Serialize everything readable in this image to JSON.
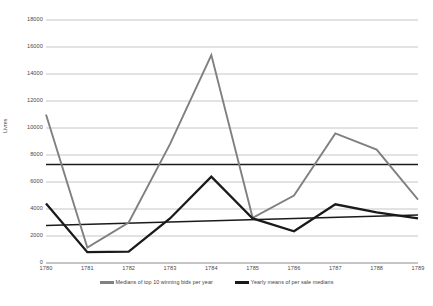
{
  "chart_data": {
    "type": "line",
    "title": "",
    "xlabel": "",
    "ylabel": "Livres",
    "categories": [
      "1780",
      "1781",
      "1782",
      "1783",
      "1784",
      "1785",
      "1786",
      "1787",
      "1788",
      "1789"
    ],
    "ylim": [
      0,
      18000
    ],
    "ytick_step": 2000,
    "yticks": [
      "0",
      "2000",
      "4000",
      "6000",
      "8000",
      "10000",
      "12000",
      "14000",
      "16000",
      "18000"
    ],
    "grid": "horizontal",
    "legend_position": "bottom",
    "series": [
      {
        "name": "Medians of top 10 winning bids per year",
        "color": "#808080",
        "values": [
          11000,
          1150,
          3000,
          8800,
          15400,
          3350,
          5000,
          9600,
          8400,
          4700
        ]
      },
      {
        "name": "Yearly means of per sale medians",
        "color": "#1a1a1a",
        "values": [
          4400,
          800,
          850,
          3300,
          6400,
          3300,
          2350,
          4350,
          3750,
          3300
        ]
      }
    ],
    "trendlines": [
      {
        "name": "trend-top-series",
        "color": "#1a1a1a",
        "start_value": 7300,
        "end_value": 7300
      },
      {
        "name": "trend-bottom-series",
        "color": "#1a1a1a",
        "start_value": 2780,
        "end_value": 3560
      }
    ]
  },
  "legend": {
    "items": [
      {
        "label": "Medians of top 10 winning bids per year",
        "color": "#808080"
      },
      {
        "label": "Yearly means of per sale medians",
        "color": "#1a1a1a"
      }
    ]
  },
  "axis": {
    "y_title": "Livres"
  },
  "colors": {
    "gridline": "#b7b7b7",
    "axis_line": "#8c8c8c",
    "series_gray": "#808080",
    "series_dark": "#1a1a1a",
    "background": "#ffffff"
  }
}
